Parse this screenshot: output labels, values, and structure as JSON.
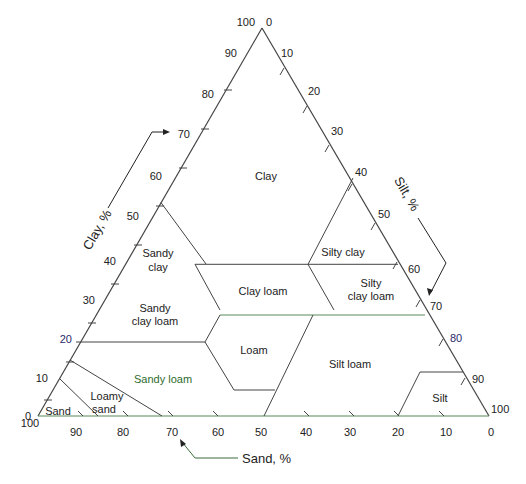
{
  "diagram": {
    "axes": {
      "clay": {
        "title": "Clay, %",
        "ticks": [
          "0",
          "10",
          "20",
          "30",
          "40",
          "50",
          "60",
          "70",
          "80",
          "90",
          "100"
        ]
      },
      "silt": {
        "title": "Silt, %",
        "ticks": [
          "0",
          "10",
          "20",
          "30",
          "40",
          "50",
          "60",
          "70",
          "80",
          "90",
          "100"
        ]
      },
      "sand": {
        "title": "Sand, %",
        "ticks": [
          "100",
          "90",
          "80",
          "70",
          "60",
          "50",
          "40",
          "30",
          "20",
          "10",
          "0"
        ]
      }
    },
    "regions": {
      "clay": "Clay",
      "sandy_clay_1": "Sandy",
      "sandy_clay_2": "clay",
      "silty_clay": "Silty clay",
      "clay_loam": "Clay loam",
      "silty_clay_loam_1": "Silty",
      "silty_clay_loam_2": "clay loam",
      "sandy_clay_loam_1": "Sandy",
      "sandy_clay_loam_2": "clay loam",
      "loam": "Loam",
      "silt_loam": "Silt loam",
      "sandy_loam": "Sandy loam",
      "loamy_sand_1": "Loamy",
      "loamy_sand_2": "sand",
      "sand": "Sand",
      "silt": "Silt"
    },
    "colors": {
      "line": "#444444",
      "green_line": "#5a8a5a",
      "blue_label": "#2a2a6a",
      "green_label": "#2d6b2d"
    }
  }
}
